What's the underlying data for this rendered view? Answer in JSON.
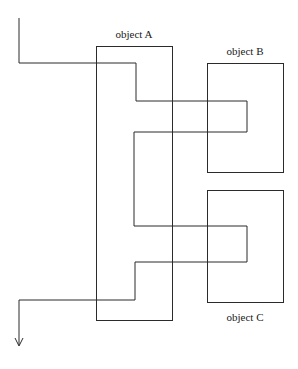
{
  "figure": {
    "title": "",
    "background_color": "#ffffff",
    "line_color": "#2b2b2b",
    "text_color": "#1a1a1a",
    "width": 298,
    "height": 369
  },
  "labels": {
    "object_a": "object A",
    "object_b": "object B",
    "object_c": "object C"
  },
  "boxes": {
    "object_a": {
      "x": 96,
      "y": 46,
      "width": 76,
      "height": 274
    },
    "object_b": {
      "x": 207,
      "y": 63,
      "width": 76,
      "height": 109
    },
    "object_c": {
      "x": 207,
      "y": 190,
      "width": 76,
      "height": 112
    }
  },
  "label_positions": {
    "object_a": {
      "x": 134,
      "y": 38
    },
    "object_b": {
      "x": 245,
      "y": 55
    },
    "object_c": {
      "x": 245,
      "y": 321
    }
  },
  "flow": {
    "description": "single orthogonal polyline weaving through object A, object B and object C",
    "points": "19,18 19,63 136,63 136,101 247,101 247,132 134,132 134,226 247,226 247,262 135,262 135,300 19,300 19,345",
    "arrow_head": "15,338 19,346 23,338",
    "start": {
      "x": 19,
      "y": 18
    },
    "end": {
      "x": 19,
      "y": 345
    }
  }
}
